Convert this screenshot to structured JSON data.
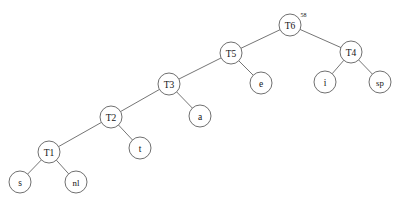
{
  "diagram": {
    "type": "binary-tree",
    "background_color": "#ffffff",
    "node_fill_color": "#ffffff",
    "node_stroke_color": "#4a4a4a",
    "edge_color": "#3a3a3a",
    "text_color": "#141414",
    "node_radius": 11,
    "nodes": [
      {
        "id": "T6",
        "label": "T6",
        "superscript": "58",
        "x": 290,
        "y": 25,
        "kind": "internal"
      },
      {
        "id": "T5",
        "label": "T5",
        "superscript": "",
        "x": 231,
        "y": 53,
        "kind": "internal"
      },
      {
        "id": "T4",
        "label": "T4",
        "superscript": "",
        "x": 351,
        "y": 52,
        "kind": "internal"
      },
      {
        "id": "T3",
        "label": "T3",
        "superscript": "",
        "x": 169,
        "y": 84,
        "kind": "internal"
      },
      {
        "id": "e",
        "label": "e",
        "superscript": "",
        "x": 261,
        "y": 83,
        "kind": "leaf"
      },
      {
        "id": "i",
        "label": "i",
        "superscript": "",
        "x": 325,
        "y": 82,
        "kind": "leaf"
      },
      {
        "id": "sp",
        "label": "sp",
        "superscript": "",
        "x": 380,
        "y": 82,
        "kind": "leaf"
      },
      {
        "id": "T2",
        "label": "T2",
        "superscript": "",
        "x": 111,
        "y": 117,
        "kind": "internal"
      },
      {
        "id": "a",
        "label": "a",
        "superscript": "",
        "x": 200,
        "y": 116,
        "kind": "leaf"
      },
      {
        "id": "t",
        "label": "t",
        "superscript": "",
        "x": 140,
        "y": 148,
        "kind": "leaf"
      },
      {
        "id": "T1",
        "label": "T1",
        "superscript": "",
        "x": 49,
        "y": 152,
        "kind": "internal"
      },
      {
        "id": "s",
        "label": "s",
        "superscript": "",
        "x": 20,
        "y": 182,
        "kind": "leaf"
      },
      {
        "id": "nl",
        "label": "nl",
        "superscript": "",
        "x": 76,
        "y": 182,
        "kind": "leaf"
      }
    ],
    "edges": [
      {
        "from": "T6",
        "to": "T5",
        "side": "left"
      },
      {
        "from": "T6",
        "to": "T4",
        "side": "right"
      },
      {
        "from": "T5",
        "to": "T3",
        "side": "left"
      },
      {
        "from": "T5",
        "to": "e",
        "side": "right"
      },
      {
        "from": "T4",
        "to": "i",
        "side": "left"
      },
      {
        "from": "T4",
        "to": "sp",
        "side": "right"
      },
      {
        "from": "T3",
        "to": "T2",
        "side": "left"
      },
      {
        "from": "T3",
        "to": "a",
        "side": "right"
      },
      {
        "from": "T2",
        "to": "T1",
        "side": "left"
      },
      {
        "from": "T2",
        "to": "t",
        "side": "right"
      },
      {
        "from": "T1",
        "to": "s",
        "side": "left"
      },
      {
        "from": "T1",
        "to": "nl",
        "side": "right"
      }
    ]
  }
}
